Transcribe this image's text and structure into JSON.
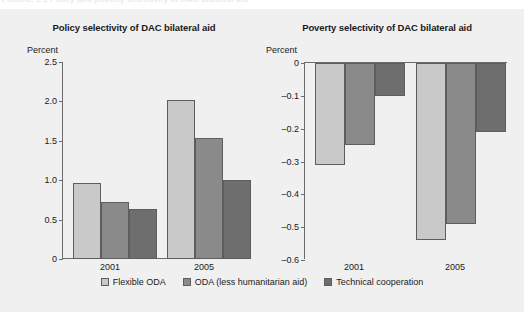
{
  "figure": {
    "caption_partial": "FIGURE 1.1   Policy and poverty selectivity of DAC bilateral aid",
    "series_colors": [
      "#c9c9c9",
      "#8a8a8a",
      "#6e6e6e"
    ]
  },
  "legend": {
    "items": [
      {
        "label": "Flexible ODA",
        "color": "#c9c9c9"
      },
      {
        "label": "ODA (less humanitarian aid)",
        "color": "#8a8a8a"
      },
      {
        "label": "Technical cooperation",
        "color": "#6e6e6e"
      }
    ]
  },
  "chart_data": [
    {
      "type": "bar",
      "title": "Policy selectivity of DAC bilateral aid",
      "xlabel": "",
      "ylabel": "Percent",
      "categories": [
        "2001",
        "2005"
      ],
      "ylim": [
        0,
        2.5
      ],
      "yticks": [
        0,
        0.5,
        1.0,
        1.5,
        2.0,
        2.5
      ],
      "ytick_labels": [
        "0",
        "0.5",
        "1.0",
        "1.5",
        "2.0",
        "2.5"
      ],
      "grid": false,
      "legend_position": "bottom",
      "series": [
        {
          "name": "Flexible ODA",
          "values": [
            0.97,
            2.02
          ]
        },
        {
          "name": "ODA (less humanitarian aid)",
          "values": [
            0.72,
            1.53
          ]
        },
        {
          "name": "Technical cooperation",
          "values": [
            0.64,
            1.0
          ]
        }
      ]
    },
    {
      "type": "bar",
      "title": "Poverty selectivity of DAC bilateral aid",
      "xlabel": "",
      "ylabel": "Percent",
      "categories": [
        "2001",
        "2005"
      ],
      "ylim": [
        -0.6,
        0
      ],
      "yticks": [
        0,
        -0.1,
        -0.2,
        -0.3,
        -0.4,
        -0.5,
        -0.6
      ],
      "ytick_labels": [
        "0",
        "–0.1",
        "–0.2",
        "–0.3",
        "–0.4",
        "–0.5",
        "–0.6"
      ],
      "grid": false,
      "legend_position": "bottom",
      "series": [
        {
          "name": "Flexible ODA",
          "values": [
            -0.31,
            -0.54
          ]
        },
        {
          "name": "ODA (less humanitarian aid)",
          "values": [
            -0.25,
            -0.49
          ]
        },
        {
          "name": "Technical cooperation",
          "values": [
            -0.1,
            -0.21
          ]
        }
      ]
    }
  ]
}
